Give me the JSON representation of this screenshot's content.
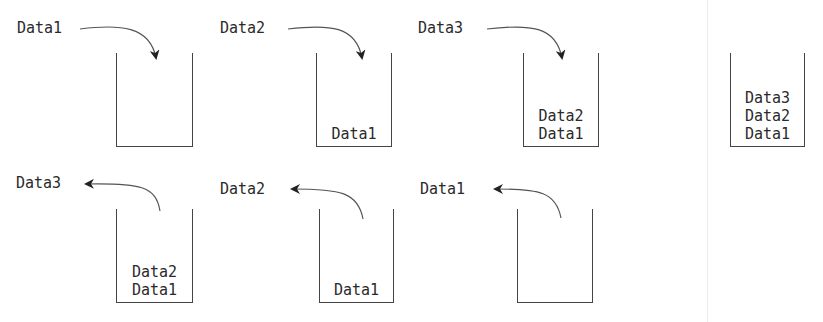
{
  "diagram": {
    "title": "",
    "push_row": {
      "steps": [
        {
          "incoming": "Data1",
          "stack": []
        },
        {
          "incoming": "Data2",
          "stack": [
            "Data1"
          ]
        },
        {
          "incoming": "Data3",
          "stack": [
            "Data2",
            "Data1"
          ]
        }
      ],
      "final_stack": [
        "Data3",
        "Data2",
        "Data1"
      ]
    },
    "pop_row": {
      "steps": [
        {
          "outgoing": "Data3",
          "stack": [
            "Data2",
            "Data1"
          ]
        },
        {
          "outgoing": "Data2",
          "stack": [
            "Data1"
          ]
        },
        {
          "outgoing": "Data1",
          "stack": []
        }
      ]
    },
    "colors": {
      "line": "#444444",
      "text": "#2a2a2a",
      "divider": "#ececec"
    }
  }
}
